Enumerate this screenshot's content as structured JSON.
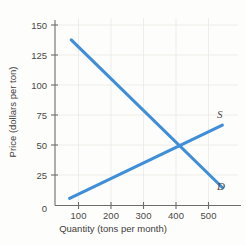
{
  "chart_data": {
    "type": "line",
    "title": "",
    "xlabel": "Quantity (tons per month)",
    "ylabel": "Price (dollars per ton)",
    "xlim": [
      0,
      560
    ],
    "ylim": [
      0,
      155
    ],
    "xticks": [
      0,
      100,
      200,
      300,
      400,
      500
    ],
    "xtick_labels": [
      "0",
      "100",
      "200",
      "300",
      "400",
      "500"
    ],
    "yticks": [
      0,
      25,
      50,
      75,
      100,
      125,
      150
    ],
    "ytick_labels": [
      "0",
      "25",
      "50",
      "75",
      "100",
      "125",
      "150"
    ],
    "grid": true,
    "legend": "inline-curve-labels",
    "series": [
      {
        "name": "D",
        "label": "D",
        "description": "Demand curve",
        "color": "#3f8fd8",
        "points": [
          [
            50,
            138
          ],
          [
            515,
            15
          ]
        ]
      },
      {
        "name": "S",
        "label": "S",
        "description": "Supply curve",
        "color": "#3f8fd8",
        "points": [
          [
            45,
            6
          ],
          [
            515,
            67
          ]
        ]
      }
    ],
    "annotations": [
      {
        "name": "equilibrium",
        "x": 400,
        "y": 50,
        "label": ""
      }
    ],
    "colors": {
      "curve": "#3f8fd8",
      "axis": "#6d6d6b",
      "grid": "#e9e9e6",
      "text": "#4a4a48",
      "background": "#fdfdfb"
    }
  }
}
